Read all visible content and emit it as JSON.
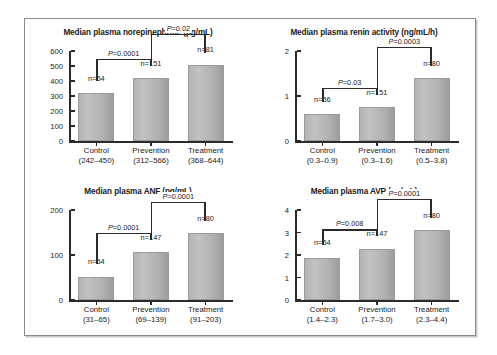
{
  "figure": {
    "border_color": "#8a8a8a",
    "background": "#ffffff",
    "bar_color": "#b4b4b4",
    "axis_color": "#2b2b2b"
  },
  "chart_data": [
    {
      "id": "norepinephrine",
      "type": "bar",
      "title": "Median plasma norepinephrine (pg/mL)",
      "xlabel": "",
      "ylabel": "",
      "ylim": [
        0,
        600
      ],
      "yticks": [
        0,
        100,
        200,
        300,
        400,
        500,
        600
      ],
      "ytick_labels": [
        "0",
        "100",
        "200",
        "300",
        "400",
        "500",
        "600"
      ],
      "grid": false,
      "categories": [
        "Control",
        "Prevention",
        "Treatment"
      ],
      "category_ranges": [
        "(242–450)",
        "(312–566)",
        "(368–644)"
      ],
      "values": [
        318,
        420,
        508
      ],
      "n_labels": [
        "n=54",
        "n=151",
        "n=81"
      ],
      "annotations": [
        {
          "text": "P=0.0001",
          "from": 0,
          "to": 1,
          "level": 1
        },
        {
          "text": "P=0.02",
          "from": 1,
          "to": 2,
          "level": 2
        }
      ]
    },
    {
      "id": "renin",
      "type": "bar",
      "title": "Median plasma renin activity (ng/mL/h)",
      "xlabel": "",
      "ylabel": "",
      "ylim": [
        0,
        2
      ],
      "yticks": [
        0,
        1,
        2
      ],
      "ytick_labels": [
        "0",
        "1",
        "2"
      ],
      "grid": false,
      "categories": [
        "Control",
        "Prevention",
        "Treatment"
      ],
      "category_ranges": [
        "(0.3–0.9)",
        "(0.3–1.6)",
        "(0.5–3.8)"
      ],
      "values": [
        0.6,
        0.75,
        1.4
      ],
      "n_labels": [
        "n=56",
        "n=151",
        "n=80"
      ],
      "annotations": [
        {
          "text": "P=0.03",
          "from": 0,
          "to": 1,
          "level": 1
        },
        {
          "text": "P=0.0003",
          "from": 1,
          "to": 2,
          "level": 2
        }
      ]
    },
    {
      "id": "anf",
      "type": "bar",
      "title": "Median plasma ANF (pg/mL)",
      "xlabel": "",
      "ylabel": "",
      "ylim": [
        0,
        200
      ],
      "yticks": [
        0,
        100,
        200
      ],
      "ytick_labels": [
        "0",
        "100",
        "200"
      ],
      "grid": false,
      "categories": [
        "Control",
        "Prevention",
        "Treatment"
      ],
      "category_ranges": [
        "(31–65)",
        "(69–139)",
        "(91–203)"
      ],
      "values": [
        52,
        106,
        148
      ],
      "n_labels": [
        "n=54",
        "n=147",
        "n=80"
      ],
      "annotations": [
        {
          "text": "P=0.0001",
          "from": 0,
          "to": 1,
          "level": 1
        },
        {
          "text": "P=0.0001",
          "from": 1,
          "to": 2,
          "level": 2
        }
      ]
    },
    {
      "id": "avp",
      "type": "bar",
      "title": "Median plasma AVP (pg/mL)",
      "xlabel": "",
      "ylabel": "",
      "ylim": [
        0,
        4
      ],
      "yticks": [
        0,
        1,
        2,
        3,
        4
      ],
      "ytick_labels": [
        "0",
        "1",
        "2",
        "3",
        "4"
      ],
      "grid": false,
      "categories": [
        "Control",
        "Prevention",
        "Treatment"
      ],
      "category_ranges": [
        "(1.4–2.3)",
        "(1.7–3.0)",
        "(2.3–4.4)"
      ],
      "values": [
        1.88,
        2.28,
        3.1
      ],
      "n_labels": [
        "n=54",
        "n=147",
        "n=80"
      ],
      "annotations": [
        {
          "text": "P=0.008",
          "from": 0,
          "to": 1,
          "level": 1
        },
        {
          "text": "P=0.0001",
          "from": 1,
          "to": 2,
          "level": 2
        }
      ]
    }
  ]
}
